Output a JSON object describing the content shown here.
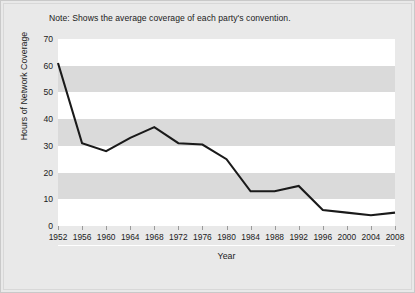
{
  "note": "Note: Shows the average coverage of each party's convention.",
  "chart_data": {
    "type": "line",
    "title": "",
    "xlabel": "Year",
    "ylabel": "Hours of Network Coverage",
    "categories": [
      1952,
      1956,
      1960,
      1964,
      1968,
      1972,
      1976,
      1980,
      1984,
      1988,
      1992,
      1996,
      2000,
      2004,
      2008
    ],
    "x_tick_labels": [
      "1952",
      "1956",
      "1960",
      "1964",
      "1968",
      "1972",
      "1976",
      "1980",
      "1984",
      "1988",
      "1992",
      "1996",
      "2000",
      "2004",
      "2008"
    ],
    "values": [
      61,
      31,
      28,
      33,
      37,
      31,
      30.5,
      25,
      13,
      13,
      15,
      6,
      5,
      4,
      5
    ],
    "ylim": [
      0,
      70
    ],
    "y_tick_labels": [
      "0",
      "10",
      "20",
      "30",
      "40",
      "50",
      "60",
      "70"
    ],
    "y_ticks": [
      0,
      10,
      20,
      30,
      40,
      50,
      60,
      70
    ],
    "xlim": [
      1952,
      2008
    ],
    "grid": "horizontal-bands",
    "legend": "none",
    "series_color": "#1a1a1a",
    "band_shade_color": "#dadada",
    "band_light_color": "#ffffff",
    "figure_background": "#e9e9e9"
  }
}
